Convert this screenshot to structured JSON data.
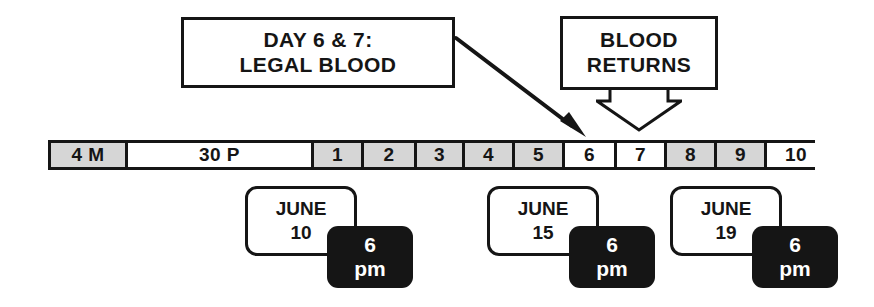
{
  "diagram": {
    "colors": {
      "ink": "#151515",
      "paper": "#ffffff",
      "shaded_cell": "#d6d6d6",
      "badge_background": "#151515",
      "badge_text": "#ffffff"
    }
  },
  "callouts": {
    "legal_blood": {
      "line1": "DAY 6 & 7:",
      "line2": "LEGAL BLOOD"
    },
    "blood_returns": {
      "line1": "BLOOD",
      "line2": "RETURNS"
    }
  },
  "arrows": {
    "legal_blood_arrow": "diagonal-arrow-to-day-6",
    "blood_returns_arrow": "hollow-down-arrow-to-day-8"
  },
  "timeline": {
    "segments": [
      {
        "label": "4 M",
        "shaded": true,
        "width": 77
      },
      {
        "label": "30 P",
        "shaded": false,
        "width": 186
      },
      {
        "label": "1",
        "shaded": true,
        "width": 50
      },
      {
        "label": "2",
        "shaded": true,
        "width": 53
      },
      {
        "label": "3",
        "shaded": true,
        "width": 48
      },
      {
        "label": "4",
        "shaded": true,
        "width": 50
      },
      {
        "label": "5",
        "shaded": true,
        "width": 50
      },
      {
        "label": "6",
        "shaded": false,
        "width": 52
      },
      {
        "label": "7",
        "shaded": false,
        "width": 50
      },
      {
        "label": "8",
        "shaded": true,
        "width": 50
      },
      {
        "label": "9",
        "shaded": true,
        "width": 50
      },
      {
        "label": "10",
        "shaded": false,
        "width": 58
      }
    ]
  },
  "dates": [
    {
      "month": "JUNE",
      "day": "10",
      "hour": "6",
      "meridiem": "pm",
      "left": 245,
      "top": 186
    },
    {
      "month": "JUNE",
      "day": "15",
      "hour": "6",
      "meridiem": "pm",
      "left": 487,
      "top": 186
    },
    {
      "month": "JUNE",
      "day": "19",
      "hour": "6",
      "meridiem": "pm",
      "left": 670,
      "top": 186
    }
  ]
}
